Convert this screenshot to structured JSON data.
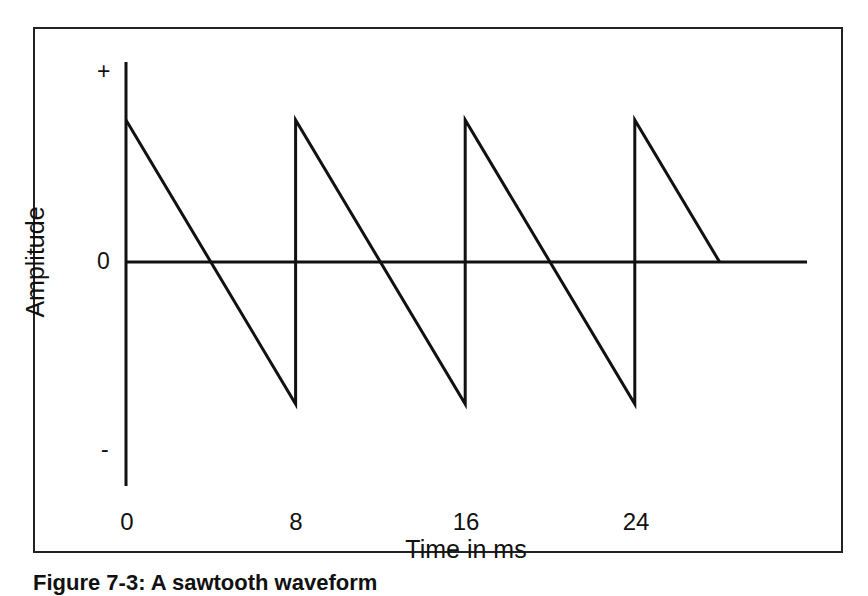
{
  "chart_data": {
    "type": "line",
    "title": "",
    "xlabel": "Time in ms",
    "ylabel": "Amplitude",
    "x_ticks": [
      "0",
      "8",
      "16",
      "24"
    ],
    "y_ticks": [
      "+",
      "0",
      "-"
    ],
    "xlim": [
      0,
      32
    ],
    "ylim": [
      -1.2,
      1.2
    ],
    "grid": false,
    "legend": null,
    "series": [
      {
        "name": "Sawtooth waveform",
        "x": [
          0,
          8,
          8,
          16,
          16,
          24,
          24,
          28
        ],
        "y": [
          1,
          -1,
          1,
          -1,
          1,
          -1,
          1,
          0
        ]
      }
    ],
    "period_ms": 8
  },
  "axes": {
    "y_plus": "+",
    "y_zero": "0",
    "y_minus": "-",
    "x_title": "Time in ms",
    "y_title": "Amplitude",
    "x_ticks": [
      "0",
      "8",
      "16",
      "24"
    ]
  },
  "caption": {
    "text": "Figure 7-3: A sawtooth waveform"
  },
  "colors": {
    "line": "#111111",
    "background": "#ffffff",
    "frame": "#222222"
  }
}
